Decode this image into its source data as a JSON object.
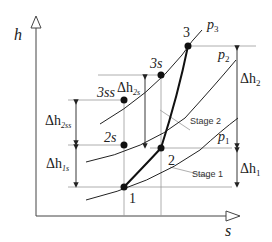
{
  "diagram": {
    "type": "h-s (Mollier) diagram, two-stage expansion",
    "axes": {
      "y_label": "h",
      "x_label": "s"
    },
    "isobars": [
      {
        "id": "p1",
        "label": "p",
        "sub": "1"
      },
      {
        "id": "p2",
        "label": "p",
        "sub": "2"
      },
      {
        "id": "p3",
        "label": "p",
        "sub": "3"
      }
    ],
    "points": [
      {
        "id": "1",
        "label": "1"
      },
      {
        "id": "2",
        "label": "2"
      },
      {
        "id": "3",
        "label": "3"
      },
      {
        "id": "2s",
        "label": "2s"
      },
      {
        "id": "3s",
        "label": "3s"
      },
      {
        "id": "3ss",
        "label": "3ss"
      }
    ],
    "deltas": [
      {
        "id": "dh1",
        "label": "Δh",
        "sub": "1"
      },
      {
        "id": "dh2",
        "label": "Δh",
        "sub": "2"
      },
      {
        "id": "dh1s",
        "label": "Δh",
        "sub": "1s"
      },
      {
        "id": "dh2s",
        "label": "Δh",
        "sub": "2s"
      },
      {
        "id": "dh2ss",
        "label": "Δh",
        "sub": "2ss"
      }
    ],
    "stage_labels": [
      {
        "id": "stage1",
        "label": "Stage 1"
      },
      {
        "id": "stage2",
        "label": "Stage 2"
      }
    ],
    "colors": {
      "line": "#222222",
      "guide": "#9a9a9a",
      "point": "#111111"
    }
  }
}
